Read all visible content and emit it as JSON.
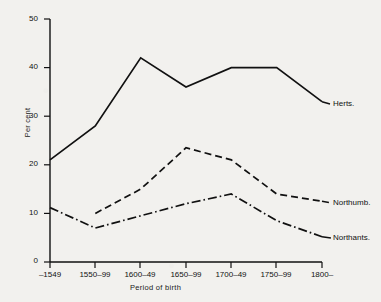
{
  "chart_data": {
    "type": "line",
    "title": "",
    "xlabel": "Period of birth",
    "ylabel": "Per cent",
    "categories": [
      "-1549",
      "1550-99",
      "1600-49",
      "1650-99",
      "1700-49",
      "1750-99",
      "1800-"
    ],
    "xtick_labels": [
      "–1549",
      "1550–99",
      "1600–49",
      "1650–99",
      "1700–49",
      "1750–99",
      "1800–"
    ],
    "ytick_labels": [
      "0",
      "10",
      "20",
      "30",
      "40",
      "50"
    ],
    "ytick_values": [
      0,
      10,
      20,
      30,
      40,
      50
    ],
    "ylim": [
      0,
      50
    ],
    "grid": false,
    "legend_position": "right-inline",
    "series": [
      {
        "name": "Herts.",
        "label": "Herts.",
        "style": "solid",
        "color": "#111111",
        "x": [
          "-1549",
          "1550-99",
          "1600-49",
          "1650-99",
          "1700-49",
          "1750-99",
          "1800-"
        ],
        "values": [
          21,
          28,
          42,
          36,
          40,
          40,
          33
        ]
      },
      {
        "name": "Northumb.",
        "label": "Northumb.",
        "style": "dashed",
        "color": "#111111",
        "x": [
          "1550-99",
          "1600-49",
          "1650-99",
          "1700-49",
          "1750-99",
          "1800-"
        ],
        "values": [
          10,
          15,
          23.5,
          21,
          14,
          12.5
        ]
      },
      {
        "name": "Northants.",
        "label": "Northants.",
        "style": "dash-dot",
        "color": "#111111",
        "x": [
          "-1549",
          "1550-99",
          "1600-49",
          "1650-99",
          "1700-49",
          "1750-99",
          "1800-"
        ],
        "values": [
          11.2,
          7,
          9.5,
          12,
          14,
          8.5,
          5.2
        ]
      }
    ]
  },
  "axis": {
    "y_title": "Per cent",
    "x_title": "Period of birth"
  }
}
